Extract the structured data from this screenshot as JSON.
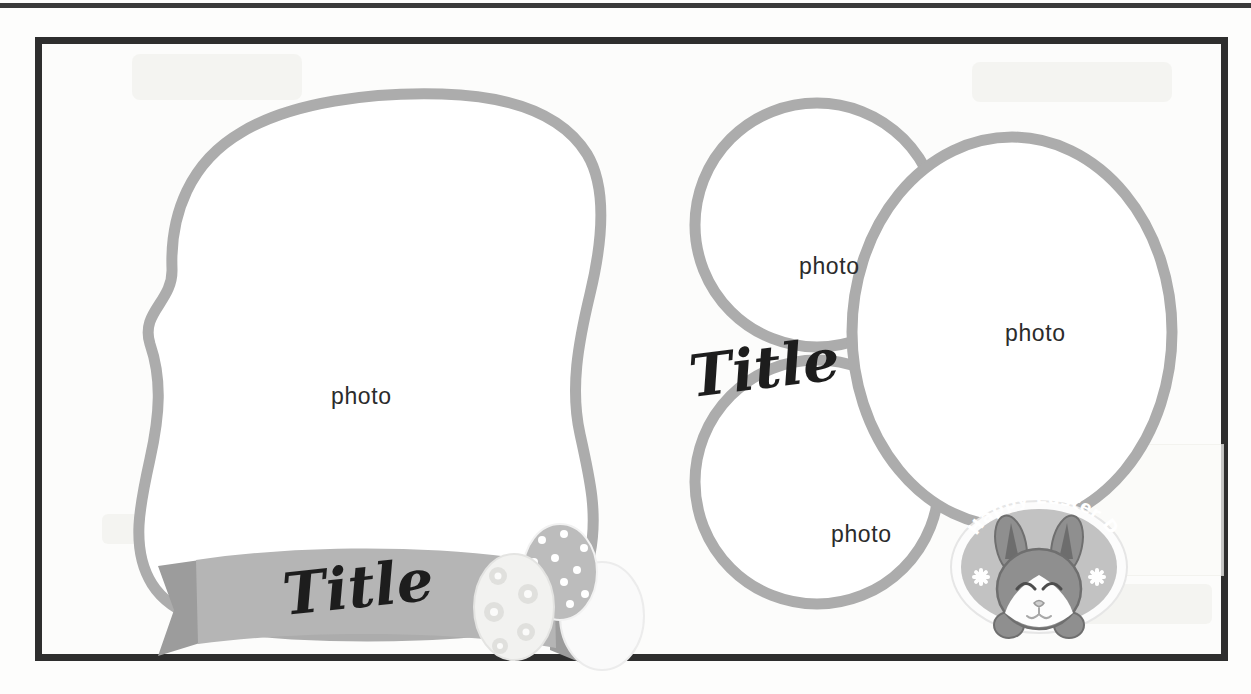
{
  "document": {
    "kind": "scrapbook-layout-template",
    "theme": "Easter",
    "background_color": "#fcfcfb",
    "frame_border_color": "#2e2e2e",
    "accent_gray": "#b3b3b3",
    "stroke_gray": "#ababab",
    "ink_black": "#1d1d1d",
    "label_gray": "#2b2b2b"
  },
  "left_panel": {
    "name": "wavy-blob-photo-frame",
    "photo_label": "photo",
    "ribbon": {
      "title_text": "Title",
      "fill_color": "#b5b5b5",
      "tail_color": "#9e9e9e"
    },
    "eggs": [
      {
        "name": "flower-egg",
        "fill": "#f3f3f1",
        "pattern": "flower-dots"
      },
      {
        "name": "polkadot-egg",
        "fill": "#b9b9b9",
        "pattern": "white-dots"
      },
      {
        "name": "plain-pale-egg",
        "fill": "#fafafa",
        "pattern": "plain"
      }
    ]
  },
  "right_panel": {
    "name": "triple-circle-photo-frames",
    "title_text": "Title",
    "photo_labels": [
      "photo",
      "photo",
      "photo"
    ],
    "frames": [
      {
        "name": "circle-top-left",
        "label": "photo"
      },
      {
        "name": "oval-right-large",
        "label": "photo"
      },
      {
        "name": "circle-bottom-left",
        "label": "photo"
      }
    ],
    "sticker": {
      "name": "easter-bunny-badge",
      "greeting": "Happy Easter Day",
      "badge_fill": "#bfbfbf",
      "badge_ring": "#f7f7f7",
      "bunny_body": "#8d8d8d",
      "bunny_ear_inner": "#6e6e6e",
      "bunny_muzzle": "#ffffff",
      "greeting_color": "#ffffff",
      "flowers": 2
    }
  }
}
